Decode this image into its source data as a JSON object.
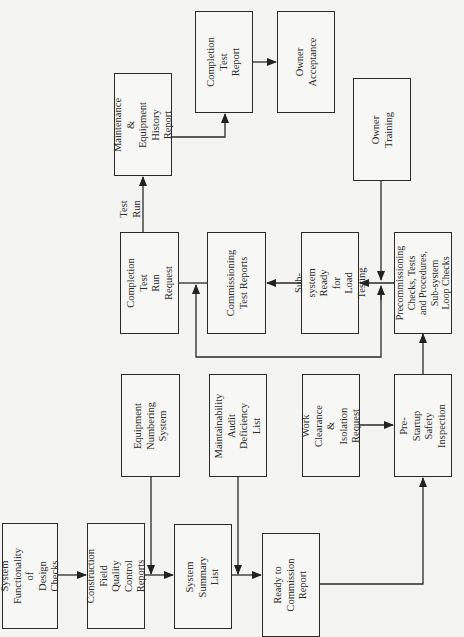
{
  "diagram": {
    "type": "flowchart",
    "orientation": "rotated -90deg (reads bottom-to-top)",
    "nodes": [
      {
        "id": "design_checks",
        "label": "System\nFunctionality of\nDesign Checks"
      },
      {
        "id": "cfqc_reports",
        "label": "Construction\nField Quality\nControl Reports"
      },
      {
        "id": "equip_numbering",
        "label": "Equipment\nNumbering\nSystem"
      },
      {
        "id": "system_summary",
        "label": "System\nSummary List"
      },
      {
        "id": "maint_audit",
        "label": "Maintainability\nAudit Deficiency\nList"
      },
      {
        "id": "ready_commission",
        "label": "Ready to\nCommission Report"
      },
      {
        "id": "work_clearance",
        "label": "Work Clearance\n& Isolation\nRequest"
      },
      {
        "id": "pre_startup",
        "label": "Pre-Startup\nSafety\nInspection"
      },
      {
        "id": "precommissioning",
        "label": "Precommissioning\nChecks, Tests\nand Procedures,\nSub-system\nLoop Checks"
      },
      {
        "id": "subsystem_ready",
        "label": "Sub-system\nReady for Load\nTesting"
      },
      {
        "id": "commissioning_reports",
        "label": "Commissioning\nTest Reports"
      },
      {
        "id": "completion_run_request",
        "label": "Completion Test\nRun Request"
      },
      {
        "id": "maint_history",
        "label": "Maintenance &\nEquipment\nHistory Report"
      },
      {
        "id": "completion_report",
        "label": "Completion Test\nReport"
      },
      {
        "id": "owner_acceptance",
        "label": "Owner\nAcceptance"
      },
      {
        "id": "owner_training",
        "label": "Owner Training"
      }
    ],
    "edge_labels": {
      "test_run": "Test\nRun"
    },
    "edges": [
      {
        "from": "design_checks",
        "to": "cfqc_reports"
      },
      {
        "from": "cfqc_reports",
        "to": "system_summary"
      },
      {
        "from": "equip_numbering",
        "to": "system_summary"
      },
      {
        "from": "system_summary",
        "to": "ready_commission"
      },
      {
        "from": "maint_audit",
        "to": "ready_commission"
      },
      {
        "from": "ready_commission",
        "to": "pre_startup"
      },
      {
        "from": "work_clearance",
        "to": "pre_startup"
      },
      {
        "from": "pre_startup",
        "to": "precommissioning"
      },
      {
        "from": "owner_training",
        "to": "precommissioning"
      },
      {
        "from": "precommissioning",
        "to": "subsystem_ready"
      },
      {
        "from": "subsystem_ready",
        "to": "commissioning_reports"
      },
      {
        "from": "precommissioning",
        "to": "completion_run_request",
        "note": "loop-back line"
      },
      {
        "from": "completion_run_request",
        "to": "maint_history",
        "label": "Test Run"
      },
      {
        "from": "maint_history",
        "to": "completion_report"
      },
      {
        "from": "completion_report",
        "to": "owner_acceptance"
      }
    ],
    "colors": {
      "line": "#2a2a2a",
      "background": "#f4f4f2",
      "text": "#2b2b2b"
    }
  }
}
